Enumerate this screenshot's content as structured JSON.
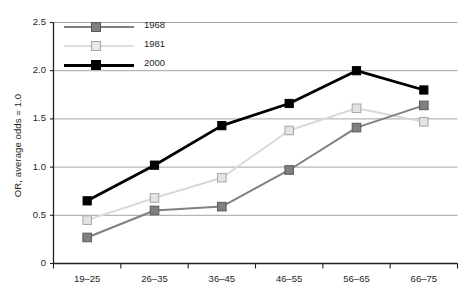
{
  "chart_data": {
    "type": "line",
    "title": "",
    "xlabel": "",
    "ylabel": "OR, average odds = 1.0",
    "categories": [
      "19–25",
      "26–35",
      "36–45",
      "46–55",
      "56–65",
      "66–75"
    ],
    "ylim": [
      0,
      2.5
    ],
    "yticks": [
      0,
      0.5,
      1.0,
      1.5,
      2.0,
      2.5
    ],
    "ytick_labels": [
      "0",
      "0.5",
      "1.0",
      "1.5",
      "2.0",
      "2.5"
    ],
    "grid": "horizontal",
    "legend_position": "top-left",
    "series": [
      {
        "name": "1968",
        "color": "#808080",
        "marker_fill": "#808080",
        "marker_edge": "#595959",
        "values": [
          0.27,
          0.55,
          0.59,
          0.97,
          1.41,
          1.64
        ]
      },
      {
        "name": "1981",
        "color": "#d9d9d9",
        "marker_fill": "#e3e3e3",
        "marker_edge": "#a6a6a6",
        "values": [
          0.45,
          0.68,
          0.89,
          1.38,
          1.61,
          1.47
        ]
      },
      {
        "name": "2000",
        "color": "#000000",
        "marker_fill": "#000000",
        "marker_edge": "#000000",
        "values": [
          0.65,
          1.02,
          1.43,
          1.66,
          2.0,
          1.8
        ]
      }
    ]
  },
  "axes": {
    "axis_color": "#231f20",
    "grid_color": "#9a9a9a"
  }
}
